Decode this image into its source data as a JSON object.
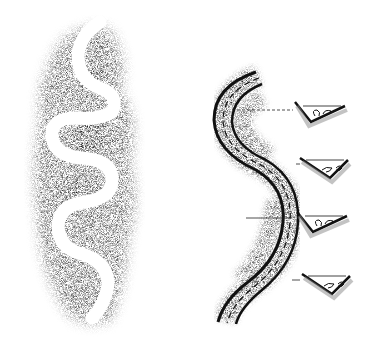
{
  "figure": {
    "title": "",
    "background": "#ffffff",
    "ink": "#111111",
    "left_panel": {
      "label": "",
      "subject": "meandering river channel with stippled floodplain"
    },
    "right_panel": {
      "label": "",
      "subject": "meander channel with dashed thalweg line",
      "cross_sections": [
        {
          "id": 1,
          "y": 104,
          "flow": "helical-left"
        },
        {
          "id": 2,
          "y": 162,
          "flow": "helical-right"
        },
        {
          "id": 3,
          "y": 218,
          "flow": "helical-left"
        },
        {
          "id": 4,
          "y": 278,
          "flow": "helical-right"
        }
      ]
    }
  }
}
